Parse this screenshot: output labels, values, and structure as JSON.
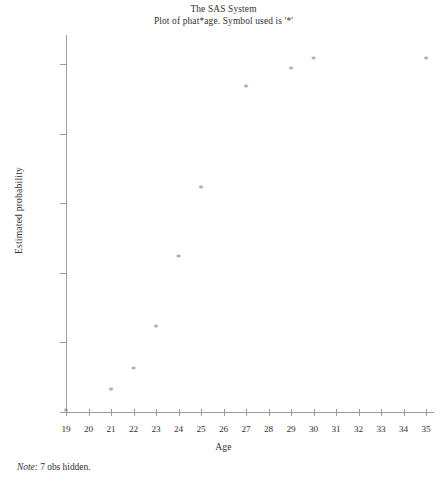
{
  "title": {
    "line1": "The SAS System",
    "line2": "Plot of phat*age. Symbol used is '*'"
  },
  "footnote": {
    "label": "Note:",
    "text": " 7 obs hidden."
  },
  "colors": {
    "axis": "#9b9b9b",
    "marker": "#8d8d8d",
    "text": "#33312f",
    "background": "#ffffff"
  },
  "chart_data": {
    "type": "scatter",
    "title": "The SAS System",
    "subtitle": "Plot of phat*age. Symbol used is '*'",
    "xlabel": "Age",
    "ylabel": "Estimated probability",
    "symbol": "*",
    "xlim": [
      18.5,
      35.7
    ],
    "ylim": [
      -0.02,
      1.06
    ],
    "xticks": [
      19,
      20,
      21,
      22,
      23,
      24,
      25,
      26,
      27,
      28,
      29,
      30,
      31,
      32,
      33,
      34,
      35
    ],
    "xtick_labels": [
      "19",
      "20",
      "21",
      "22",
      "23",
      "24",
      "25",
      "26",
      "27",
      "28",
      "29",
      "30",
      "31",
      "32",
      "33",
      "34",
      "35"
    ],
    "yticks": [
      0.0,
      0.2,
      0.4,
      0.6,
      0.8,
      1.0
    ],
    "ytick_labels": [
      "0.0",
      "0.2",
      "0.4",
      "0.6",
      "0.8",
      "1.0"
    ],
    "grid": false,
    "legend": false,
    "x": [
      19,
      21,
      22,
      23,
      24,
      25,
      27,
      29,
      30,
      35
    ],
    "y": [
      0.0,
      0.06,
      0.12,
      0.24,
      0.44,
      0.64,
      0.93,
      0.98,
      1.01,
      1.01
    ],
    "points": [
      {
        "age": 19,
        "probability": 0.0
      },
      {
        "age": 21,
        "probability": 0.06
      },
      {
        "age": 22,
        "probability": 0.12
      },
      {
        "age": 23,
        "probability": 0.24
      },
      {
        "age": 24,
        "probability": 0.44
      },
      {
        "age": 25,
        "probability": 0.64
      },
      {
        "age": 27,
        "probability": 0.93
      },
      {
        "age": 29,
        "probability": 0.98
      },
      {
        "age": 30,
        "probability": 1.01
      },
      {
        "age": 35,
        "probability": 1.01
      }
    ],
    "annotation": "Note: 7 obs hidden."
  }
}
